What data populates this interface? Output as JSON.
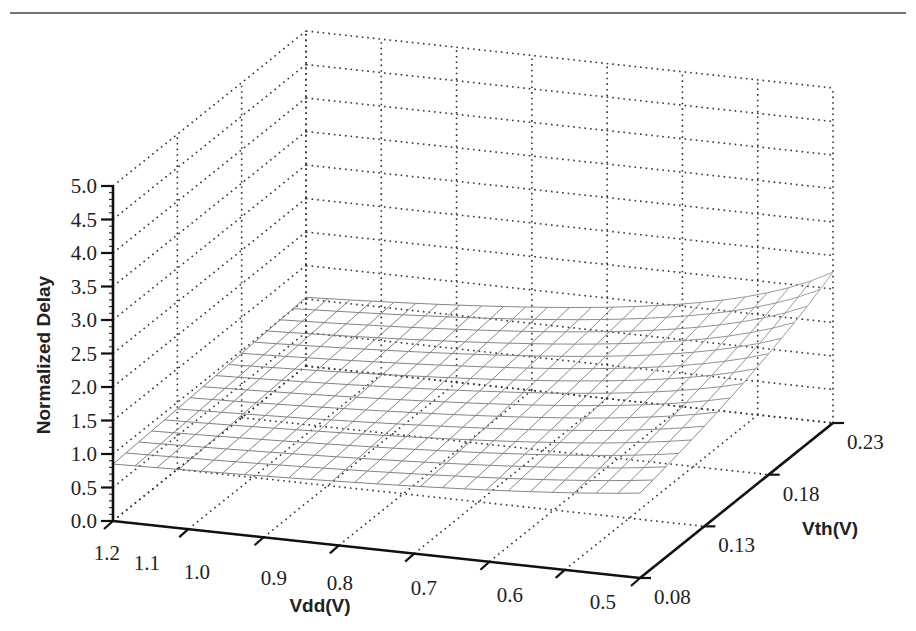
{
  "chart_data": {
    "type": "surface",
    "title": "",
    "xlabel": "Vdd(V)",
    "ylabel": "Vth(V)",
    "zlabel": "Normalized Delay",
    "x_ticks": [
      "1.2",
      "1.1",
      "1.0",
      "0.9",
      "0.8",
      "0.7",
      "0.6",
      "0.5"
    ],
    "x_tick_values": [
      1.2,
      1.1,
      1.0,
      0.9,
      0.8,
      0.7,
      0.6,
      0.5
    ],
    "y_ticks": [
      "0.08",
      "0.13",
      "0.18",
      "0.23"
    ],
    "y_tick_values": [
      0.08,
      0.13,
      0.18,
      0.23
    ],
    "z_ticks": [
      "0.0",
      "0.5",
      "1.0",
      "1.5",
      "2.0",
      "2.5",
      "3.0",
      "3.5",
      "4.0",
      "4.5",
      "5.0"
    ],
    "z_tick_values": [
      0.0,
      0.5,
      1.0,
      1.5,
      2.0,
      2.5,
      3.0,
      3.5,
      4.0,
      4.5,
      5.0
    ],
    "xlim": [
      1.2,
      0.5
    ],
    "ylim": [
      0.08,
      0.23
    ],
    "zlim": [
      0,
      5
    ],
    "grid": true,
    "surface": {
      "description": "Alpha-power-law delay, normalized to Vdd=1.2V, Vth=0.08V",
      "model": "delay ∝ Vdd / (Vdd - Vth)^alpha",
      "alpha": 1.3,
      "x_samples": 25,
      "y_samples": 16,
      "sample_points": [
        {
          "vdd": 1.2,
          "vth": 0.08,
          "delay": 0.85
        },
        {
          "vdd": 1.2,
          "vth": 0.23,
          "delay": 1.05
        },
        {
          "vdd": 0.5,
          "vth": 0.08,
          "delay": 1.7
        },
        {
          "vdd": 0.5,
          "vth": 0.23,
          "delay": 4.9
        }
      ]
    },
    "mesh_color": "#8a8a8a"
  }
}
